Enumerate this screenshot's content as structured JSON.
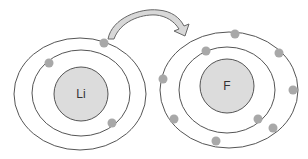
{
  "diagram": {
    "type": "electron-transfer",
    "colors": {
      "nucleus_fill": "#dcdcdc",
      "electron_fill": "#a8a8a8",
      "orbit_stroke": "#555555",
      "arrow_fill": "#d8d8d8",
      "arrow_stroke": "#666666"
    },
    "atoms": [
      {
        "id": "lithium",
        "label": "Li",
        "nucleus": {
          "cx": 81,
          "cy": 94,
          "r": 27
        },
        "shells": [
          {
            "cx": 81,
            "cy": 93,
            "rx": 49,
            "ry": 43
          },
          {
            "cx": 80,
            "cy": 94,
            "rx": 66,
            "ry": 56
          }
        ],
        "electrons": [
          {
            "cx": 104,
            "cy": 43
          },
          {
            "cx": 49,
            "cy": 63
          },
          {
            "cx": 112,
            "cy": 123
          }
        ]
      },
      {
        "id": "fluorine",
        "label": "F",
        "nucleus": {
          "cx": 227,
          "cy": 86,
          "r": 27
        },
        "shells": [
          {
            "cx": 227,
            "cy": 90,
            "rx": 48,
            "ry": 43
          },
          {
            "cx": 229,
            "cy": 90,
            "rx": 69,
            "ry": 58
          }
        ],
        "electrons": [
          {
            "cx": 206,
            "cy": 51
          },
          {
            "cx": 258,
            "cy": 119
          },
          {
            "cx": 235,
            "cy": 34
          },
          {
            "cx": 279,
            "cy": 53
          },
          {
            "cx": 293,
            "cy": 90
          },
          {
            "cx": 273,
            "cy": 128
          },
          {
            "cx": 216,
            "cy": 141
          },
          {
            "cx": 174,
            "cy": 119
          },
          {
            "cx": 163,
            "cy": 79
          }
        ]
      }
    ],
    "arrow": {
      "from": "lithium",
      "to": "fluorine",
      "description": "curved arrow showing electron transfer from Li outer electron to F"
    }
  }
}
